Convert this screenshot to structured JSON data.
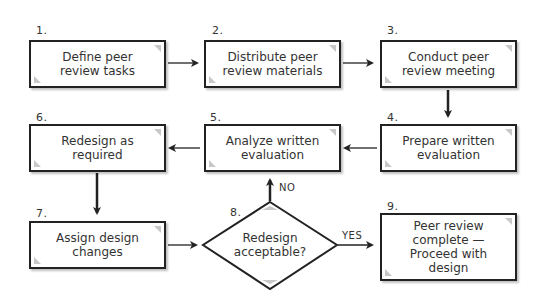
{
  "diagram": {
    "type": "flowchart",
    "steps": [
      {
        "number": "1.",
        "label": "Define peer\nreview tasks"
      },
      {
        "number": "2.",
        "label": "Distribute peer\nreview materials"
      },
      {
        "number": "3.",
        "label": "Conduct peer\nreview meeting"
      },
      {
        "number": "4.",
        "label": "Prepare written\nevaluation"
      },
      {
        "number": "5.",
        "label": "Analyze written\nevaluation"
      },
      {
        "number": "6.",
        "label": "Redesign as\nrequired"
      },
      {
        "number": "7.",
        "label": "Assign design\nchanges"
      },
      {
        "number": "8.",
        "label": "Redesign\nacceptable?",
        "shape": "decision"
      },
      {
        "number": "9.",
        "label": "Peer review\ncomplete —\nProceed with\ndesign"
      }
    ],
    "edges": [
      {
        "from": "1",
        "to": "2"
      },
      {
        "from": "2",
        "to": "3"
      },
      {
        "from": "3",
        "to": "4"
      },
      {
        "from": "4",
        "to": "5"
      },
      {
        "from": "5",
        "to": "6"
      },
      {
        "from": "6",
        "to": "7"
      },
      {
        "from": "7",
        "to": "8"
      },
      {
        "from": "8",
        "to": "5",
        "label": "NO"
      },
      {
        "from": "8",
        "to": "9",
        "label": "YES"
      }
    ],
    "edge_labels": {
      "no": "NO",
      "yes": "YES"
    },
    "colors": {
      "stroke": "#222222",
      "fill": "#ffffff",
      "corner": "#c8c8c8"
    }
  }
}
